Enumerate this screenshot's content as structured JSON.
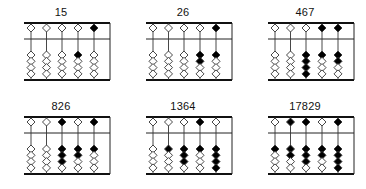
{
  "figure": {
    "bead_colors": {
      "active": "#000000",
      "inactive": "#ffffff",
      "outline": "#333333"
    },
    "abaci": [
      {
        "label": "15",
        "rods": [
          {
            "upper": false,
            "lower": 0
          },
          {
            "upper": false,
            "lower": 0
          },
          {
            "upper": false,
            "lower": 0
          },
          {
            "upper": false,
            "lower": 1
          },
          {
            "upper": true,
            "lower": 0
          }
        ]
      },
      {
        "label": "26",
        "rods": [
          {
            "upper": false,
            "lower": 0
          },
          {
            "upper": false,
            "lower": 0
          },
          {
            "upper": false,
            "lower": 0
          },
          {
            "upper": false,
            "lower": 2
          },
          {
            "upper": true,
            "lower": 1
          }
        ]
      },
      {
        "label": "467",
        "rods": [
          {
            "upper": false,
            "lower": 0
          },
          {
            "upper": false,
            "lower": 0
          },
          {
            "upper": false,
            "lower": 4
          },
          {
            "upper": true,
            "lower": 1
          },
          {
            "upper": true,
            "lower": 2
          }
        ]
      },
      {
        "label": "826",
        "rods": [
          {
            "upper": false,
            "lower": 0
          },
          {
            "upper": false,
            "lower": 0
          },
          {
            "upper": true,
            "lower": 3
          },
          {
            "upper": false,
            "lower": 2
          },
          {
            "upper": true,
            "lower": 1
          }
        ]
      },
      {
        "label": "1364",
        "rods": [
          {
            "upper": false,
            "lower": 0
          },
          {
            "upper": false,
            "lower": 1
          },
          {
            "upper": false,
            "lower": 3
          },
          {
            "upper": true,
            "lower": 1
          },
          {
            "upper": false,
            "lower": 4
          }
        ]
      },
      {
        "label": "17829",
        "rods": [
          {
            "upper": false,
            "lower": 1
          },
          {
            "upper": true,
            "lower": 2
          },
          {
            "upper": true,
            "lower": 3
          },
          {
            "upper": false,
            "lower": 2
          },
          {
            "upper": true,
            "lower": 4
          }
        ]
      }
    ]
  }
}
